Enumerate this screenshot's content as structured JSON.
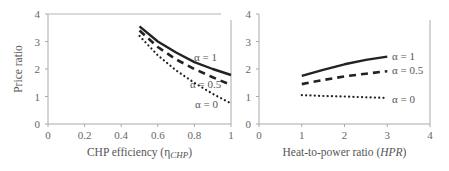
{
  "chart_data": [
    {
      "type": "line",
      "title": "",
      "xlabel": "CHP efficiency (η_CHP)",
      "xlabel_main": "CHP efficiency (η",
      "xlabel_sub": "CHP",
      "xlabel_end": ")",
      "ylabel": "Price ratio",
      "xlim": [
        0,
        1
      ],
      "ylim": [
        0,
        4
      ],
      "xticks": [
        "0",
        "0.2",
        "0.4",
        "0.6",
        "0.8",
        "1"
      ],
      "yticks": [
        "0",
        "1",
        "2",
        "3",
        "4"
      ],
      "grid": false,
      "legend_position": "inline labels at line ends",
      "series": [
        {
          "name": "α = 1",
          "style": "solid",
          "x": [
            0.5,
            0.6,
            0.7,
            0.8,
            0.9,
            1.0
          ],
          "y": [
            3.55,
            3.0,
            2.6,
            2.25,
            2.0,
            1.78
          ]
        },
        {
          "name": "α = 0.5",
          "style": "dashed",
          "x": [
            0.5,
            0.6,
            0.7,
            0.8,
            0.9,
            1.0
          ],
          "y": [
            3.4,
            2.8,
            2.35,
            2.0,
            1.7,
            1.42
          ]
        },
        {
          "name": "α = 0",
          "style": "dotted",
          "x": [
            0.5,
            0.6,
            0.7,
            0.8,
            0.9,
            1.0
          ],
          "y": [
            3.2,
            2.5,
            1.95,
            1.5,
            1.1,
            0.75
          ]
        }
      ]
    },
    {
      "type": "line",
      "title": "",
      "xlabel": "Heat-to-power ratio (HPR)",
      "xlabel_main": "Heat-to-power ratio (",
      "xlabel_ital": "HPR",
      "xlabel_end": ")",
      "ylabel": "",
      "xlim": [
        0,
        4
      ],
      "ylim": [
        0,
        4
      ],
      "xticks": [
        "0",
        "1",
        "2",
        "3",
        "4"
      ],
      "yticks": [
        "0",
        "1",
        "2",
        "3",
        "4"
      ],
      "grid": false,
      "legend_position": "inline labels at line ends",
      "series": [
        {
          "name": "α = 1",
          "style": "solid",
          "x": [
            1,
            1.5,
            2,
            2.5,
            3
          ],
          "y": [
            1.75,
            1.97,
            2.17,
            2.33,
            2.45
          ]
        },
        {
          "name": "α = 0.5",
          "style": "dashed",
          "x": [
            1,
            1.5,
            2,
            2.5,
            3
          ],
          "y": [
            1.45,
            1.6,
            1.73,
            1.83,
            1.92
          ]
        },
        {
          "name": "α = 0",
          "style": "dotted",
          "x": [
            1,
            1.5,
            2,
            2.5,
            3
          ],
          "y": [
            1.05,
            1.02,
            1.0,
            0.97,
            0.95
          ]
        }
      ]
    }
  ]
}
